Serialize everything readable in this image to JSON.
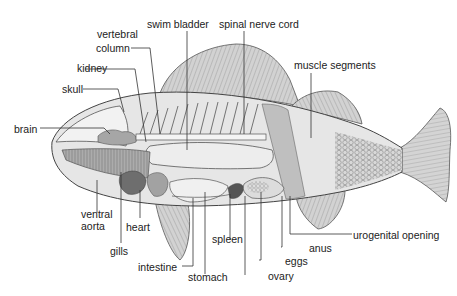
{
  "colors": {
    "outline": "#444444",
    "body_fill": "#e4e4e4",
    "fin_fill": "#cfcfcf",
    "organ_mid": "#a8a8a8",
    "organ_dark": "#707070",
    "leader": "#333333",
    "text": "#222222"
  },
  "labels": {
    "swim_bladder": "swim bladder",
    "spinal_nerve_cord": "spinal nerve cord",
    "vertebral_column_1": "vertebral",
    "vertebral_column_2": "column",
    "kidney": "kidney",
    "skull": "skull",
    "brain": "brain",
    "muscle_segments": "muscle segments",
    "ventral_aorta_1": "ventral",
    "ventral_aorta_2": "aorta",
    "heart": "heart",
    "gills": "gills",
    "intestine": "intestine",
    "stomach": "stomach",
    "spleen": "spleen",
    "ovary": "ovary",
    "eggs": "eggs",
    "anus": "anus",
    "urogenital_opening": "urogenital opening"
  }
}
